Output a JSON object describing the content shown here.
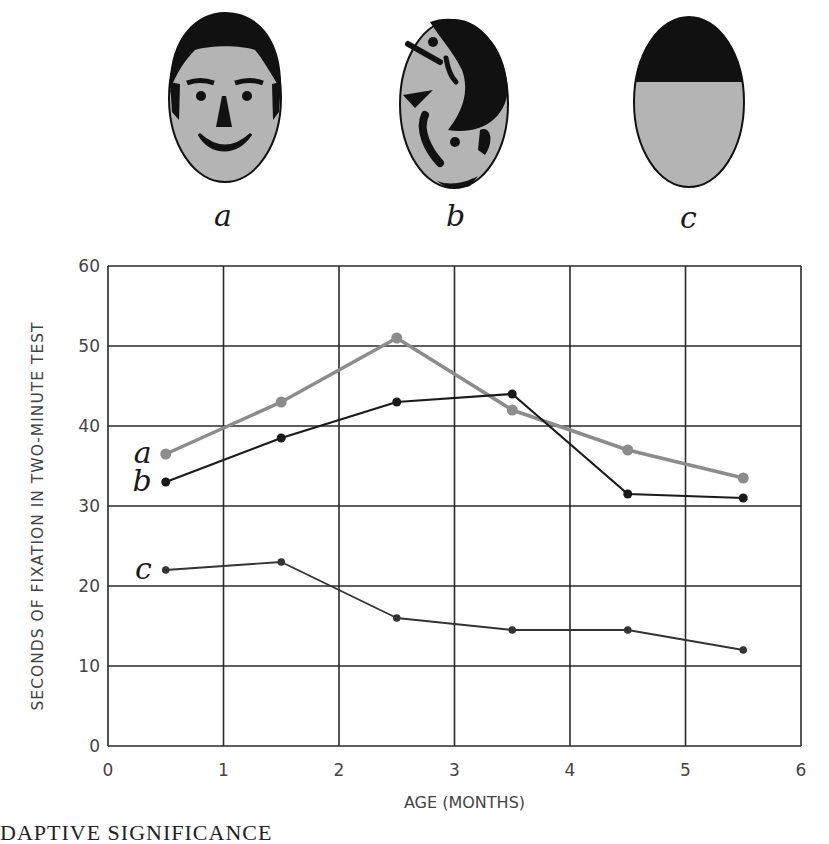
{
  "figure": {
    "faces": [
      {
        "id": "a",
        "label": "a",
        "description": "schematic face with eyes, eyebrows, nose, smiling mouth and hair"
      },
      {
        "id": "b",
        "label": "b",
        "description": "scrambled facial features"
      },
      {
        "id": "c",
        "label": "c",
        "description": "head shape with dark top band, no features"
      }
    ],
    "caption_partial": "DAPTIVE SIGNIFICANCE"
  },
  "chart_data": {
    "type": "line",
    "title": "",
    "xlabel": "AGE (MONTHS)",
    "ylabel": "SECONDS OF FIXATION IN TWO-MINUTE TEST",
    "xlim": [
      0,
      6
    ],
    "ylim": [
      0,
      60
    ],
    "x_ticks": [
      "0",
      "1",
      "2",
      "3",
      "4",
      "5",
      "6"
    ],
    "y_ticks": [
      "0",
      "10",
      "20",
      "30",
      "40",
      "50",
      "60"
    ],
    "grid": true,
    "legend_position": "inline labels at left of lines",
    "x": [
      0.5,
      1.5,
      2.5,
      3.5,
      4.5,
      5.5
    ],
    "series": [
      {
        "name": "a",
        "color": "#8c8c8c",
        "values": [
          36.5,
          43,
          51,
          42,
          37,
          33.5
        ]
      },
      {
        "name": "b",
        "color": "#1a1a1a",
        "values": [
          33,
          38.5,
          43,
          44,
          31.5,
          31
        ]
      },
      {
        "name": "c",
        "color": "#333333",
        "values": [
          22,
          23,
          16,
          14.5,
          14.5,
          12
        ]
      }
    ]
  }
}
